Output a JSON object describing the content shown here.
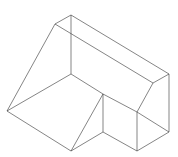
{
  "diagram": {
    "type": "isometric-wireframe",
    "stroke_color": "#333333",
    "background": "#ffffff",
    "vertices": {
      "A": [
        71,
        15
      ],
      "B": [
        55,
        24
      ],
      "C": [
        71,
        33
      ],
      "D": [
        169,
        74
      ],
      "E": [
        153,
        83
      ],
      "F": [
        71,
        74
      ],
      "G": [
        7,
        111
      ],
      "H": [
        71,
        151
      ],
      "I": [
        103,
        94
      ],
      "J": [
        103,
        132
      ],
      "K": [
        137,
        112
      ],
      "L": [
        137,
        151
      ],
      "M": [
        169,
        132
      ]
    },
    "edges": [
      [
        "A",
        "B"
      ],
      [
        "A",
        "D"
      ],
      [
        "B",
        "E"
      ],
      [
        "A",
        "C"
      ],
      [
        "C",
        "F"
      ],
      [
        "D",
        "E"
      ],
      [
        "B",
        "G"
      ],
      [
        "G",
        "F"
      ],
      [
        "G",
        "H"
      ],
      [
        "F",
        "I"
      ],
      [
        "I",
        "K"
      ],
      [
        "E",
        "K"
      ],
      [
        "I",
        "J"
      ],
      [
        "H",
        "I"
      ],
      [
        "H",
        "J"
      ],
      [
        "J",
        "L"
      ],
      [
        "K",
        "L"
      ],
      [
        "L",
        "M"
      ],
      [
        "D",
        "M"
      ],
      [
        "K",
        "M"
      ]
    ]
  }
}
